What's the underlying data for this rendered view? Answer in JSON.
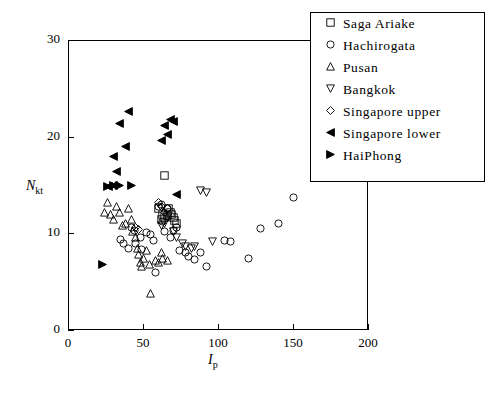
{
  "chart_data": {
    "type": "scatter",
    "title": "",
    "xlabel": "I_p",
    "ylabel": "N_kt",
    "xlim": [
      0,
      200
    ],
    "ylim": [
      0,
      30
    ],
    "xticks": [
      0,
      50,
      100,
      150,
      200
    ],
    "yticks": [
      0,
      10,
      20,
      30
    ],
    "grid": false,
    "legend_position": "top-right",
    "series": [
      {
        "name": "Saga Ariake",
        "marker": "square-open",
        "points": [
          [
            60,
            12.6
          ],
          [
            62,
            11.4
          ],
          [
            63,
            12.0
          ],
          [
            64,
            11.6
          ],
          [
            64,
            16.0
          ],
          [
            66,
            11.8
          ],
          [
            67,
            12.6
          ],
          [
            68,
            12.2
          ],
          [
            69,
            11.9
          ],
          [
            70,
            11.6
          ],
          [
            71,
            11.3
          ],
          [
            72,
            11.0
          ]
        ]
      },
      {
        "name": "Hachirogata",
        "marker": "circle-open",
        "points": [
          [
            35,
            9.4
          ],
          [
            37,
            9.0
          ],
          [
            40,
            8.4
          ],
          [
            42,
            10.6
          ],
          [
            44,
            10.3
          ],
          [
            45,
            9.0
          ],
          [
            48,
            9.6
          ],
          [
            49,
            8.3
          ],
          [
            52,
            10.1
          ],
          [
            55,
            9.9
          ],
          [
            57,
            9.3
          ],
          [
            58,
            6.0
          ],
          [
            60,
            12.8
          ],
          [
            62,
            13.0
          ],
          [
            63,
            11.2
          ],
          [
            64,
            10.2
          ],
          [
            66,
            12.6
          ],
          [
            68,
            9.6
          ],
          [
            70,
            10.3
          ],
          [
            72,
            10.6
          ],
          [
            74,
            8.2
          ],
          [
            78,
            8.0
          ],
          [
            80,
            7.6
          ],
          [
            84,
            7.3
          ],
          [
            88,
            8.0
          ],
          [
            92,
            6.6
          ],
          [
            104,
            9.3
          ],
          [
            108,
            9.2
          ],
          [
            120,
            7.4
          ],
          [
            128,
            10.5
          ],
          [
            140,
            11.0
          ],
          [
            150,
            13.7
          ]
        ]
      },
      {
        "name": "Pusan",
        "marker": "triangle-up-open",
        "points": [
          [
            24,
            12.2
          ],
          [
            26,
            13.2
          ],
          [
            28,
            12.0
          ],
          [
            30,
            11.4
          ],
          [
            32,
            12.8
          ],
          [
            34,
            12.2
          ],
          [
            36,
            10.8
          ],
          [
            38,
            11.0
          ],
          [
            40,
            12.6
          ],
          [
            42,
            11.4
          ],
          [
            43,
            10.2
          ],
          [
            45,
            9.6
          ],
          [
            46,
            8.4
          ],
          [
            47,
            7.8
          ],
          [
            48,
            7.0
          ],
          [
            49,
            6.6
          ],
          [
            50,
            7.4
          ],
          [
            52,
            8.2
          ],
          [
            54,
            6.8
          ],
          [
            55,
            3.8
          ],
          [
            58,
            7.2
          ],
          [
            60,
            7.0
          ],
          [
            62,
            8.0
          ],
          [
            63,
            7.4
          ],
          [
            66,
            7.2
          ]
        ]
      },
      {
        "name": "Bangkok",
        "marker": "triangle-down-open",
        "points": [
          [
            62,
            10.8
          ],
          [
            64,
            11.0
          ],
          [
            66,
            11.6
          ],
          [
            70,
            10.2
          ],
          [
            72,
            9.6
          ],
          [
            76,
            9.0
          ],
          [
            78,
            8.6
          ],
          [
            82,
            8.4
          ],
          [
            84,
            8.6
          ],
          [
            88,
            14.4
          ],
          [
            92,
            14.2
          ],
          [
            96,
            9.2
          ]
        ]
      },
      {
        "name": "Singapore upper",
        "marker": "diamond-open",
        "points": [
          [
            45,
            10.6
          ],
          [
            47,
            10.4
          ],
          [
            60,
            13.2
          ],
          [
            62,
            12.8
          ],
          [
            64,
            12.2
          ],
          [
            66,
            12.6
          ]
        ]
      },
      {
        "name": "Singapore lower",
        "marker": "triangle-left-filled",
        "points": [
          [
            27,
            14.8
          ],
          [
            30,
            15.0
          ],
          [
            30,
            18.0
          ],
          [
            32,
            16.4
          ],
          [
            34,
            21.4
          ],
          [
            38,
            19.0
          ],
          [
            40,
            22.6
          ],
          [
            62,
            19.6
          ],
          [
            64,
            21.2
          ],
          [
            66,
            20.2
          ],
          [
            68,
            21.8
          ],
          [
            70,
            21.6
          ],
          [
            72,
            14.0
          ]
        ]
      },
      {
        "name": "HaiPhong",
        "marker": "triangle-right-filled",
        "points": [
          [
            23,
            6.8
          ],
          [
            26,
            14.8
          ],
          [
            30,
            14.9
          ],
          [
            34,
            15.0
          ],
          [
            42,
            15.0
          ]
        ]
      }
    ]
  },
  "legend": {
    "items": [
      {
        "label": "Saga Ariake",
        "marker": "square-open"
      },
      {
        "label": "Hachirogata",
        "marker": "circle-open"
      },
      {
        "label": "Pusan",
        "marker": "triangle-up-open"
      },
      {
        "label": "Bangkok",
        "marker": "triangle-down-open"
      },
      {
        "label": "Singapore upper",
        "marker": "diamond-open"
      },
      {
        "label": "Singapore lower",
        "marker": "triangle-left-filled"
      },
      {
        "label": "HaiPhong",
        "marker": "triangle-right-filled"
      }
    ]
  },
  "axes": {
    "y_title_main": "N",
    "y_title_sub": "kt",
    "x_title_main": "I",
    "x_title_sub": "p"
  },
  "colors": {
    "foreground": "#000000",
    "background": "#ffffff"
  }
}
